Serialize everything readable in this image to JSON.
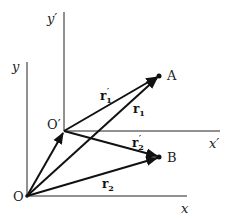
{
  "diagram": {
    "type": "vector-frames",
    "frames": {
      "unprimed": {
        "origin_label": "O",
        "x_axis_label": "x",
        "y_axis_label": "y"
      },
      "primed": {
        "origin_label": "O′",
        "x_axis_label": "x′",
        "y_axis_label": "y′"
      }
    },
    "points": [
      {
        "id": "A",
        "label": "A"
      },
      {
        "id": "B",
        "label": "B"
      }
    ],
    "vectors": [
      {
        "id": "r1",
        "main": "r",
        "sub": "1",
        "prime": "",
        "from": "O",
        "to": "A"
      },
      {
        "id": "r2",
        "main": "r",
        "sub": "2",
        "prime": "",
        "from": "O",
        "to": "B"
      },
      {
        "id": "r1p",
        "main": "r",
        "sub": "1",
        "prime": "′",
        "from": "O′",
        "to": "A"
      },
      {
        "id": "r2p",
        "main": "r",
        "sub": "2",
        "prime": "′",
        "from": "O′",
        "to": "B"
      },
      {
        "id": "OOp",
        "main": "",
        "sub": "",
        "prime": "",
        "from": "O",
        "to": "O′"
      }
    ],
    "colors": {
      "line": "#111111",
      "background": "#ffffff"
    }
  }
}
